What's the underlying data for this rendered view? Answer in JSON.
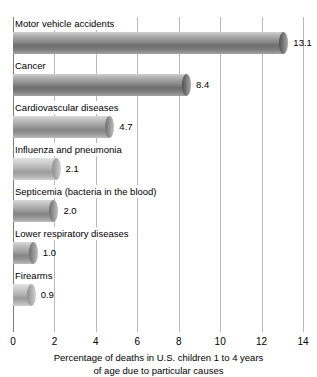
{
  "chart_data": {
    "type": "bar",
    "orientation": "horizontal",
    "title": "",
    "xlabel": "Percentage of deaths in U.S. children 1 to 4 years of age due to particular causes",
    "ylabel": "",
    "xlim": [
      0,
      14
    ],
    "xticks": [
      0,
      2,
      4,
      6,
      8,
      10,
      12,
      14
    ],
    "xtick_labels": [
      "0",
      "2",
      "4",
      "6",
      "8",
      "10",
      "12",
      "14"
    ],
    "grid": true,
    "legend": false,
    "categories": [
      "Motor vehicle accidents",
      "Cancer",
      "Cardiovascular diseases",
      "Influenza and pneumonia",
      "Septicemia (bacteria in the blood)",
      "Lower respiratory diseases",
      "Firearms"
    ],
    "values": [
      13.1,
      8.4,
      4.7,
      2.1,
      2.0,
      1.0,
      0.9
    ],
    "value_labels": [
      "13.1",
      "8.4",
      "4.7",
      "2.1",
      "2.0",
      "1.0",
      "0.9"
    ],
    "bar_style": [
      "dark",
      "dark",
      "mid",
      "light",
      "mid",
      "mid",
      "light"
    ],
    "colors": {
      "bar_dark_top": "#cfcfcf",
      "bar_dark_core": "#6d6d6d",
      "bar_light_top": "#e3e3e3",
      "bar_light_core": "#9c9c9c",
      "gridline": "#b9b9b9",
      "axis": "#7c7c7c",
      "text": "#000000",
      "background": "#ffffff"
    }
  },
  "axis_title_lines": [
    "Percentage of deaths in U.S. children 1 to 4 years",
    "of age due to particular causes"
  ]
}
